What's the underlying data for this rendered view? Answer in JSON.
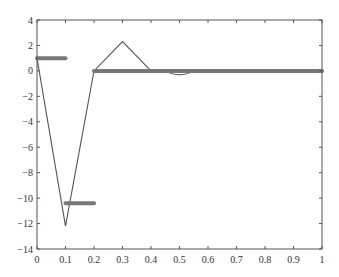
{
  "chart_data": {
    "type": "line",
    "title": "",
    "xlabel": "",
    "ylabel": "",
    "xlim": [
      0,
      1
    ],
    "ylim": [
      -14,
      4
    ],
    "grid": false,
    "legend": null,
    "x_ticks": [
      "0",
      "0.1",
      "0.2",
      "0.3",
      "0.4",
      "0.5",
      "0.6",
      "0.7",
      "0.8",
      "0.9",
      "1"
    ],
    "y_ticks": [
      "4",
      "2",
      "0",
      "−2",
      "−4",
      "−6",
      "−8",
      "−10",
      "−12",
      "−14"
    ],
    "series": [
      {
        "name": "thin-line",
        "style": "thin",
        "color": "#555555",
        "x": [
          0,
          0.1,
          0.2,
          0.3,
          0.4
        ],
        "y": [
          1.0,
          -12.2,
          0.0,
          2.3,
          0.0
        ]
      },
      {
        "name": "thin-dip",
        "style": "thin",
        "color": "#555555",
        "x": [
          0.45,
          0.5,
          0.55
        ],
        "y": [
          0.0,
          -0.3,
          0.0
        ]
      },
      {
        "name": "thick-segment-1",
        "style": "thick",
        "color": "#777777",
        "x": [
          0,
          0.1
        ],
        "y": [
          1.0,
          1.0
        ]
      },
      {
        "name": "thick-segment-2",
        "style": "thick",
        "color": "#777777",
        "x": [
          0.1,
          0.2
        ],
        "y": [
          -10.4,
          -10.4
        ]
      },
      {
        "name": "thick-segment-3",
        "style": "thick",
        "color": "#777777",
        "x": [
          0.2,
          1.0
        ],
        "y": [
          0.0,
          0.0
        ]
      }
    ]
  }
}
